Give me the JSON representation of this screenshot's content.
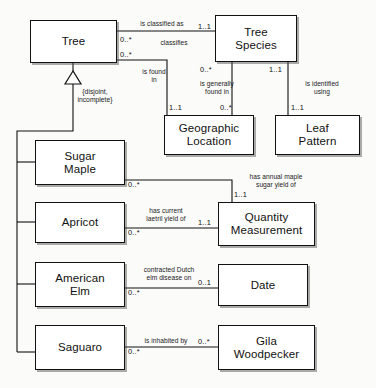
{
  "diagram": {
    "type": "uml-class-diagram",
    "background_color": "#fbfbfa",
    "line_color": "#111111",
    "box_fill": "#ffffff",
    "classes": [
      {
        "id": "tree",
        "name": "Tree"
      },
      {
        "id": "tree-species",
        "name": "Tree\nSpecies"
      },
      {
        "id": "geographic-location",
        "name": "Geographic\nLocation"
      },
      {
        "id": "leaf-pattern",
        "name": "Leaf\nPattern"
      },
      {
        "id": "sugar-maple",
        "name": "Sugar\nMaple"
      },
      {
        "id": "apricot",
        "name": "Apricot"
      },
      {
        "id": "american-elm",
        "name": "American\nElm"
      },
      {
        "id": "saguaro",
        "name": "Saguaro"
      },
      {
        "id": "quantity-measurement",
        "name": "Quantity\nMeasurement"
      },
      {
        "id": "date",
        "name": "Date"
      },
      {
        "id": "gila-woodpecker",
        "name": "Gila\nWoodpecker"
      }
    ],
    "generalization": {
      "parent": "tree",
      "children": [
        "sugar-maple",
        "apricot",
        "american-elm",
        "saguaro"
      ],
      "constraint": "{disjoint,\nincomplete}"
    },
    "associations": [
      {
        "id": "tree-classified-as-species",
        "from": "tree",
        "to": "tree-species",
        "label_forward": "is classified as",
        "label_reverse": "classifies",
        "mult_from": "0..*",
        "mult_to": "1..1"
      },
      {
        "id": "tree-found-in-location",
        "from": "tree",
        "to": "geographic-location",
        "label_forward": "is found\nin",
        "mult_from": "0..*",
        "mult_to": "1..1"
      },
      {
        "id": "species-generally-found-in-location",
        "from": "tree-species",
        "to": "geographic-location",
        "label_forward": "is generally\nfound in",
        "mult_from": "0..*",
        "mult_to": "0..*"
      },
      {
        "id": "species-identified-using-leaf-pattern",
        "from": "tree-species",
        "to": "leaf-pattern",
        "label_forward": "is identified\nusing",
        "mult_from": "1..1",
        "mult_to": "1..1"
      },
      {
        "id": "sugar-maple-annual-yield",
        "from": "sugar-maple",
        "to": "quantity-measurement",
        "label_forward": "has annual maple\nsugar yield of",
        "mult_from": "0..*",
        "mult_to": "1..1"
      },
      {
        "id": "apricot-laetril-yield",
        "from": "apricot",
        "to": "quantity-measurement",
        "label_forward": "has current\nlaetril yield of",
        "mult_from": "0..*",
        "mult_to": "1..1"
      },
      {
        "id": "american-elm-dutch-elm-disease",
        "from": "american-elm",
        "to": "date",
        "label_forward": "contracted Dutch\nelm disease on",
        "mult_from": "0..*",
        "mult_to": "0..1"
      },
      {
        "id": "saguaro-inhabited-by-woodpecker",
        "from": "saguaro",
        "to": "gila-woodpecker",
        "label_forward": "is inhabited by",
        "mult_from": "0..*",
        "mult_to": "0..*"
      }
    ]
  }
}
